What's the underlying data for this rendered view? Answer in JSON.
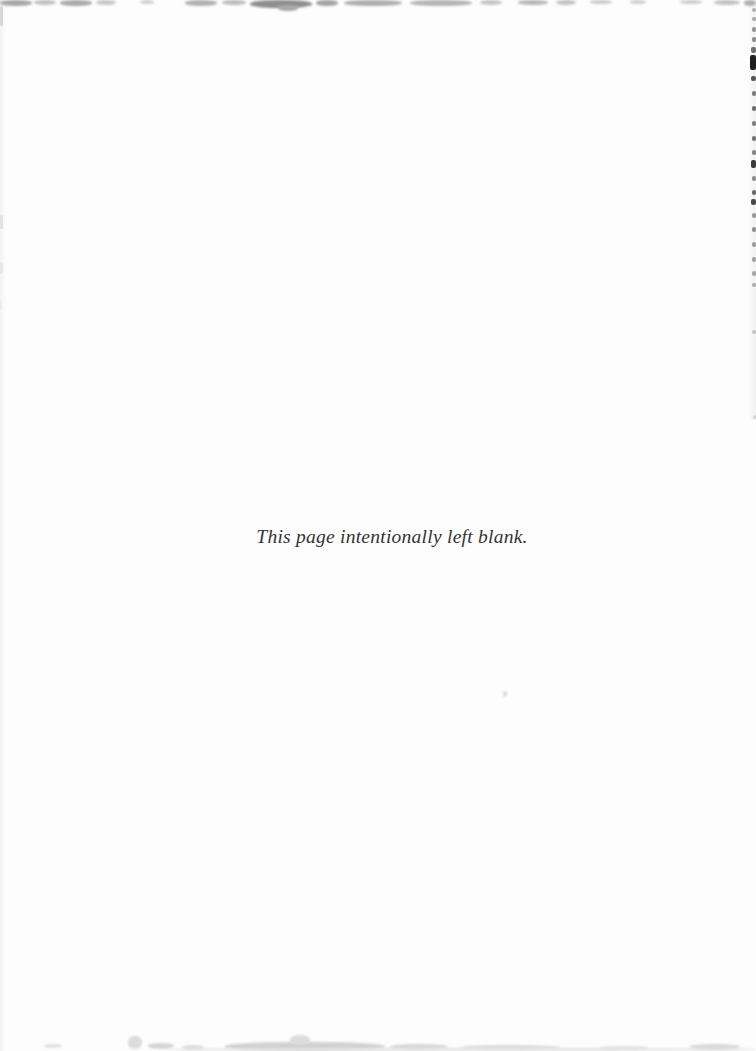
{
  "page": {
    "text": "This page intentionally left blank.",
    "text_color": "#343434",
    "background": "#fdfdfd"
  },
  "artifacts": {
    "top_edge_smudges": [
      {
        "x": 0,
        "y": 0,
        "w": 32,
        "h": 6,
        "color": "#a8a8a8"
      },
      {
        "x": 34,
        "y": 0,
        "w": 22,
        "h": 5,
        "color": "#c2c2c2"
      },
      {
        "x": 60,
        "y": 0,
        "w": 32,
        "h": 6,
        "color": "#ababab"
      },
      {
        "x": 96,
        "y": 0,
        "w": 20,
        "h": 5,
        "color": "#c8c8c8"
      },
      {
        "x": 140,
        "y": 0,
        "w": 14,
        "h": 4,
        "color": "#d2d2d2"
      },
      {
        "x": 185,
        "y": 0,
        "w": 32,
        "h": 6,
        "color": "#b2b2b2"
      },
      {
        "x": 222,
        "y": 0,
        "w": 24,
        "h": 5,
        "color": "#bdbdbd"
      },
      {
        "x": 250,
        "y": 0,
        "w": 62,
        "h": 8,
        "color": "#8f8f8f"
      },
      {
        "x": 278,
        "y": 5,
        "w": 20,
        "h": 6,
        "color": "#a9a9a9"
      },
      {
        "x": 316,
        "y": 0,
        "w": 22,
        "h": 6,
        "color": "#a4a4a4"
      },
      {
        "x": 344,
        "y": 0,
        "w": 58,
        "h": 6,
        "color": "#b0b0b0"
      },
      {
        "x": 410,
        "y": 0,
        "w": 62,
        "h": 6,
        "color": "#b4b4b4"
      },
      {
        "x": 480,
        "y": 0,
        "w": 22,
        "h": 5,
        "color": "#c6c6c6"
      },
      {
        "x": 518,
        "y": 0,
        "w": 30,
        "h": 5,
        "color": "#b8b8b8"
      },
      {
        "x": 556,
        "y": 0,
        "w": 20,
        "h": 5,
        "color": "#c4c4c4"
      },
      {
        "x": 590,
        "y": 0,
        "w": 22,
        "h": 4,
        "color": "#cccccc"
      },
      {
        "x": 630,
        "y": 0,
        "w": 16,
        "h": 4,
        "color": "#d0d0d0"
      },
      {
        "x": 680,
        "y": 0,
        "w": 22,
        "h": 4,
        "color": "#cfcfcf"
      },
      {
        "x": 714,
        "y": 0,
        "w": 26,
        "h": 5,
        "color": "#c2c2c2"
      },
      {
        "x": 744,
        "y": 0,
        "w": 12,
        "h": 6,
        "color": "#b0b0b0"
      }
    ],
    "bottom_edge_smudges": [
      {
        "x": 44,
        "y": 1044,
        "w": 18,
        "h": 4,
        "color": "#e2e2e2"
      },
      {
        "x": 128,
        "y": 1036,
        "w": 14,
        "h": 13,
        "color": "#dcdcdc"
      },
      {
        "x": 148,
        "y": 1043,
        "w": 26,
        "h": 6,
        "color": "#d6d6d6"
      },
      {
        "x": 182,
        "y": 1045,
        "w": 22,
        "h": 5,
        "color": "#dedede"
      },
      {
        "x": 225,
        "y": 1042,
        "w": 160,
        "h": 9,
        "color": "#d2d2d2"
      },
      {
        "x": 290,
        "y": 1035,
        "w": 20,
        "h": 10,
        "color": "#dcdcdc"
      },
      {
        "x": 390,
        "y": 1044,
        "w": 58,
        "h": 6,
        "color": "#d8d8d8"
      },
      {
        "x": 460,
        "y": 1045,
        "w": 100,
        "h": 5,
        "color": "#dcdcdc"
      },
      {
        "x": 600,
        "y": 1046,
        "w": 48,
        "h": 4,
        "color": "#e3e3e3"
      },
      {
        "x": 690,
        "y": 1044,
        "w": 50,
        "h": 6,
        "color": "#dadada"
      },
      {
        "x": 170,
        "y": 1048,
        "w": 586,
        "h": 3,
        "color": "#e4e4e4"
      }
    ],
    "right_edge_ticks": [
      {
        "y": 8,
        "h": 4,
        "w": 4,
        "color": "#b2b2b2"
      },
      {
        "y": 17,
        "h": 4,
        "w": 4,
        "color": "#a6a6a6"
      },
      {
        "y": 27,
        "h": 5,
        "w": 4,
        "color": "#949494"
      },
      {
        "y": 37,
        "h": 5,
        "w": 4,
        "color": "#8c8c8c"
      },
      {
        "y": 47,
        "h": 6,
        "w": 5,
        "color": "#6f6f6f"
      },
      {
        "y": 55,
        "h": 15,
        "w": 6,
        "color": "#1f1f1f"
      },
      {
        "y": 76,
        "h": 5,
        "w": 5,
        "color": "#585858"
      },
      {
        "y": 91,
        "h": 5,
        "w": 4,
        "color": "#787878"
      },
      {
        "y": 106,
        "h": 5,
        "w": 4,
        "color": "#6a6a6a"
      },
      {
        "y": 121,
        "h": 5,
        "w": 4,
        "color": "#7a7a7a"
      },
      {
        "y": 136,
        "h": 5,
        "w": 4,
        "color": "#707070"
      },
      {
        "y": 150,
        "h": 5,
        "w": 4,
        "color": "#828282"
      },
      {
        "y": 160,
        "h": 8,
        "w": 5,
        "color": "#3c3c3c"
      },
      {
        "y": 176,
        "h": 5,
        "w": 4,
        "color": "#8c8c8c"
      },
      {
        "y": 190,
        "h": 5,
        "w": 4,
        "color": "#686868"
      },
      {
        "y": 199,
        "h": 6,
        "w": 5,
        "color": "#484848"
      },
      {
        "y": 213,
        "h": 5,
        "w": 4,
        "color": "#989898"
      },
      {
        "y": 227,
        "h": 5,
        "w": 4,
        "color": "#8f8f8f"
      },
      {
        "y": 242,
        "h": 5,
        "w": 4,
        "color": "#9a9a9a"
      },
      {
        "y": 257,
        "h": 5,
        "w": 4,
        "color": "#a0a0a0"
      },
      {
        "y": 271,
        "h": 5,
        "w": 4,
        "color": "#a6a6a6"
      },
      {
        "y": 283,
        "h": 4,
        "w": 4,
        "color": "#ababab"
      },
      {
        "y": 330,
        "h": 4,
        "w": 4,
        "color": "#c4c4c4"
      },
      {
        "y": 415,
        "h": 4,
        "w": 3,
        "color": "#d6d6d6"
      }
    ],
    "left_edge_marks": [
      {
        "y": 6,
        "h": 20,
        "w": 3,
        "color": "#d6d6d6"
      },
      {
        "y": 215,
        "h": 14,
        "w": 3,
        "color": "#e2e2e2"
      },
      {
        "y": 262,
        "h": 12,
        "w": 3,
        "color": "#e6e6e6"
      },
      {
        "y": 300,
        "h": 10,
        "w": 2,
        "color": "#ececec"
      }
    ],
    "speck": {
      "x": 503,
      "y": 691,
      "w": 4,
      "h": 6,
      "color": "#d9d9d9"
    }
  }
}
